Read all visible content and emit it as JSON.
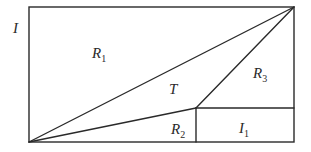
{
  "diagram": {
    "type": "region-partition",
    "outer_label": "I",
    "regions": [
      {
        "id": "R1",
        "main": "R",
        "sub": "1"
      },
      {
        "id": "T",
        "main": "T",
        "sub": ""
      },
      {
        "id": "R3",
        "main": "R",
        "sub": "3"
      },
      {
        "id": "R2",
        "main": "R",
        "sub": "2"
      },
      {
        "id": "I1",
        "main": "I",
        "sub": "1"
      }
    ],
    "colors": {
      "stroke": "#2a2a2a",
      "background": "#ffffff"
    }
  }
}
